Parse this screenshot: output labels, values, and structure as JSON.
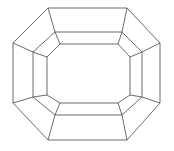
{
  "figure": {
    "canvas": {
      "width": 174,
      "height": 151,
      "background_color": "#ffffff"
    },
    "style": {
      "stroke_color": "#5a5a5a",
      "stroke_width": 0.9,
      "fill": "none"
    },
    "rings": [
      {
        "name": "outer-octagon",
        "sides": 8,
        "points": "48,8 127,8 160,43 160,103 127,140 48,140 13,103 13,43"
      },
      {
        "name": "middle-octagon",
        "sides": 8,
        "points": "55,32 122,32 142,52 142,97 122,115 55,115 33,97 33,52"
      },
      {
        "name": "inner-octagon",
        "sides": 8,
        "points": "60,44 118,44 130,57 130,95 118,103 60,103 47,95 47,57"
      }
    ],
    "spokes": [
      {
        "name": "spoke-top-left",
        "outer": "48,8",
        "middle": "55,32",
        "inner": "60,44"
      },
      {
        "name": "spoke-top-right",
        "outer": "127,8",
        "middle": "122,32",
        "inner": "118,44"
      },
      {
        "name": "spoke-right-upper",
        "outer": "160,43",
        "middle": "142,52",
        "inner": "130,57"
      },
      {
        "name": "spoke-right-lower",
        "outer": "160,103",
        "middle": "142,97",
        "inner": "130,95"
      },
      {
        "name": "spoke-bottom-right",
        "outer": "127,140",
        "middle": "122,115",
        "inner": "118,103"
      },
      {
        "name": "spoke-bottom-left",
        "outer": "48,140",
        "middle": "55,115",
        "inner": "60,103"
      },
      {
        "name": "spoke-left-lower",
        "outer": "13,103",
        "middle": "33,97",
        "inner": "47,95"
      },
      {
        "name": "spoke-left-upper",
        "outer": "13,43",
        "middle": "33,52",
        "inner": "47,57"
      }
    ]
  }
}
